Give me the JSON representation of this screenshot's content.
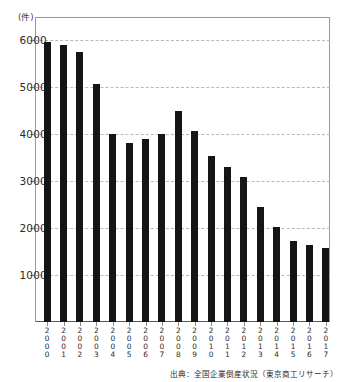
{
  "chart_data": {
    "type": "bar",
    "title": "",
    "subtitle": "",
    "xlabel": "",
    "ylabel": "(件)",
    "unit_label": "(件)",
    "categories": [
      "2000",
      "2001",
      "2002",
      "2003",
      "2004",
      "2005",
      "2006",
      "2007",
      "2008",
      "2009",
      "2010",
      "2011",
      "2012",
      "2013",
      "2014",
      "2015",
      "2016",
      "2017"
    ],
    "values": [
      5970,
      5910,
      5750,
      5080,
      4000,
      3810,
      3910,
      4010,
      4490,
      4080,
      3540,
      3310,
      3080,
      2450,
      2020,
      1720,
      1640,
      1580
    ],
    "ylim": [
      0,
      6500
    ],
    "yticks": [
      1000,
      2000,
      3000,
      4000,
      5000,
      6000
    ],
    "ytick_labels": [
      "1000",
      "2000",
      "3000",
      "4000",
      "5000",
      "6000"
    ],
    "grid": true,
    "legend": null,
    "legend_position": "none",
    "bar_color": "#151515",
    "grid_color": "#b9b9b9",
    "axis_color": "#8a8a8a",
    "annotations": []
  },
  "footer": {
    "source_note": "出典：全国企業倒産状況（東京商工リサーチ）"
  }
}
